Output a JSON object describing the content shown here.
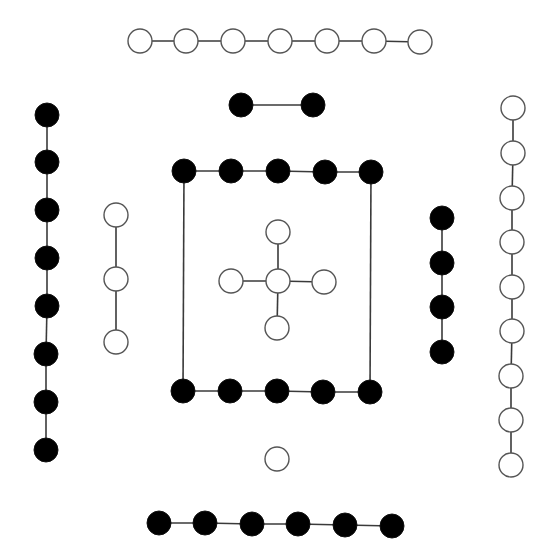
{
  "diagram": {
    "width": 553,
    "height": 560,
    "node_radius": 12,
    "colors": {
      "black_fill": "#000000",
      "white_fill": "#ffffff",
      "edge": "#3a3a3a",
      "white_stroke": "#555555"
    },
    "groups": [
      {
        "name": "top-white-chain",
        "color": "white",
        "connected": true,
        "nodes": [
          [
            140,
            41
          ],
          [
            186,
            41
          ],
          [
            233,
            41
          ],
          [
            280,
            41
          ],
          [
            327,
            41
          ],
          [
            374,
            41
          ],
          [
            420,
            42
          ]
        ]
      },
      {
        "name": "black-pair",
        "color": "black",
        "connected": true,
        "nodes": [
          [
            241,
            105
          ],
          [
            313,
            105
          ]
        ]
      },
      {
        "name": "left-black-chain",
        "color": "black",
        "connected": true,
        "nodes": [
          [
            47,
            115
          ],
          [
            47,
            162
          ],
          [
            47,
            210
          ],
          [
            47,
            258
          ],
          [
            47,
            306
          ],
          [
            46,
            354
          ],
          [
            46,
            402
          ],
          [
            46,
            450
          ]
        ]
      },
      {
        "name": "left-white-chain",
        "color": "white",
        "connected": true,
        "nodes": [
          [
            116,
            215
          ],
          [
            116,
            279
          ],
          [
            116,
            342
          ]
        ]
      },
      {
        "name": "square-top-row",
        "color": "black",
        "connected": true,
        "nodes": [
          [
            184,
            171
          ],
          [
            231,
            171
          ],
          [
            278,
            171
          ],
          [
            325,
            172
          ],
          [
            371,
            172
          ]
        ]
      },
      {
        "name": "square-bottom-row",
        "color": "black",
        "connected": true,
        "nodes": [
          [
            183,
            391
          ],
          [
            230,
            391
          ],
          [
            277,
            391
          ],
          [
            323,
            392
          ],
          [
            370,
            392
          ]
        ]
      },
      {
        "name": "square-left-side",
        "color": "black",
        "connected": true,
        "edge_only": true,
        "nodes": [
          [
            184,
            171
          ],
          [
            183,
            391
          ]
        ]
      },
      {
        "name": "square-right-side",
        "color": "black",
        "connected": true,
        "edge_only": true,
        "nodes": [
          [
            371,
            172
          ],
          [
            370,
            392
          ]
        ]
      },
      {
        "name": "cross-vertical",
        "color": "white",
        "connected": true,
        "nodes": [
          [
            278,
            232
          ],
          [
            278,
            281
          ],
          [
            277,
            328
          ]
        ]
      },
      {
        "name": "cross-horizontal",
        "color": "white",
        "connected": true,
        "nodes": [
          [
            231,
            281
          ],
          [
            278,
            281
          ],
          [
            324,
            282
          ]
        ]
      },
      {
        "name": "right-black-chain",
        "color": "black",
        "connected": true,
        "nodes": [
          [
            442,
            218
          ],
          [
            442,
            263
          ],
          [
            442,
            307
          ],
          [
            442,
            352
          ]
        ]
      },
      {
        "name": "right-white-chain",
        "color": "white",
        "connected": true,
        "nodes": [
          [
            513,
            108
          ],
          [
            513,
            153
          ],
          [
            512,
            198
          ],
          [
            512,
            242
          ],
          [
            512,
            287
          ],
          [
            512,
            331
          ],
          [
            511,
            376
          ],
          [
            511,
            420
          ],
          [
            511,
            465
          ]
        ]
      },
      {
        "name": "isolated-white-node",
        "color": "white",
        "connected": false,
        "nodes": [
          [
            277,
            459
          ]
        ]
      },
      {
        "name": "bottom-black-chain",
        "color": "black",
        "connected": true,
        "nodes": [
          [
            159,
            523
          ],
          [
            205,
            523
          ],
          [
            252,
            524
          ],
          [
            298,
            524
          ],
          [
            345,
            525
          ],
          [
            392,
            526
          ]
        ]
      }
    ]
  }
}
